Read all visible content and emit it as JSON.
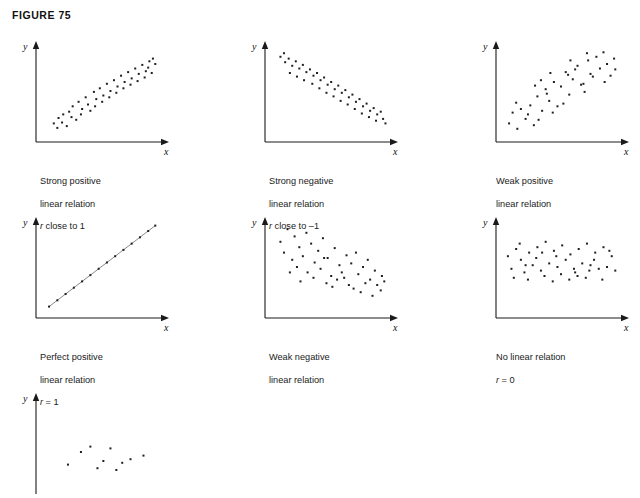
{
  "figure": {
    "title": "FIGURE 75",
    "axis_x_label": "x",
    "axis_y_label": "y",
    "background_color": "#ffffff",
    "ink_color": "#1a1a1a",
    "point_color": "#202020"
  },
  "chart_data": [
    {
      "type": "scatter",
      "title": "Strong positive linear relation",
      "caption_line1": "Strong positive",
      "caption_line2": "linear relation",
      "caption_r_prefix": "r",
      "caption_r_rest": " close to 1",
      "xlabel": "x",
      "ylabel": "y",
      "xlim": [
        0,
        100
      ],
      "ylim": [
        0,
        100
      ],
      "grid": false,
      "r_value": "close to 1",
      "points": [
        [
          10,
          14
        ],
        [
          14,
          20
        ],
        [
          13,
          9
        ],
        [
          18,
          24
        ],
        [
          17,
          15
        ],
        [
          21,
          11
        ],
        [
          23,
          27
        ],
        [
          26,
          33
        ],
        [
          25,
          21
        ],
        [
          29,
          18
        ],
        [
          31,
          38
        ],
        [
          34,
          30
        ],
        [
          33,
          24
        ],
        [
          37,
          43
        ],
        [
          39,
          35
        ],
        [
          41,
          28
        ],
        [
          44,
          49
        ],
        [
          46,
          41
        ],
        [
          45,
          33
        ],
        [
          49,
          53
        ],
        [
          52,
          45
        ],
        [
          51,
          38
        ],
        [
          55,
          58
        ],
        [
          58,
          50
        ],
        [
          57,
          43
        ],
        [
          61,
          62
        ],
        [
          64,
          55
        ],
        [
          63,
          48
        ],
        [
          67,
          67
        ],
        [
          70,
          60
        ],
        [
          69,
          53
        ],
        [
          73,
          71
        ],
        [
          76,
          64
        ],
        [
          75,
          57
        ],
        [
          79,
          75
        ],
        [
          82,
          69
        ],
        [
          81,
          61
        ],
        [
          85,
          79
        ],
        [
          88,
          72
        ],
        [
          87,
          65
        ],
        [
          91,
          83
        ],
        [
          90,
          76
        ],
        [
          94,
          86
        ],
        [
          93,
          70
        ],
        [
          96,
          80
        ]
      ]
    },
    {
      "type": "scatter",
      "title": "Strong negative linear relation",
      "caption_line1": "Strong negative",
      "caption_line2": "linear relation",
      "caption_r_prefix": "r",
      "caption_r_rest": " close to –1",
      "xlabel": "x",
      "ylabel": "y",
      "xlim": [
        0,
        100
      ],
      "ylim": [
        0,
        100
      ],
      "grid": false,
      "r_value": "close to -1",
      "points": [
        [
          8,
          88
        ],
        [
          12,
          82
        ],
        [
          11,
          92
        ],
        [
          15,
          86
        ],
        [
          18,
          78
        ],
        [
          16,
          70
        ],
        [
          21,
          83
        ],
        [
          24,
          75
        ],
        [
          22,
          66
        ],
        [
          27,
          79
        ],
        [
          30,
          71
        ],
        [
          28,
          62
        ],
        [
          33,
          74
        ],
        [
          36,
          67
        ],
        [
          35,
          58
        ],
        [
          39,
          70
        ],
        [
          42,
          62
        ],
        [
          41,
          53
        ],
        [
          45,
          65
        ],
        [
          48,
          57
        ],
        [
          47,
          48
        ],
        [
          51,
          60
        ],
        [
          54,
          52
        ],
        [
          53,
          44
        ],
        [
          57,
          56
        ],
        [
          60,
          48
        ],
        [
          59,
          39
        ],
        [
          63,
          51
        ],
        [
          66,
          43
        ],
        [
          65,
          35
        ],
        [
          69,
          46
        ],
        [
          72,
          38
        ],
        [
          71,
          30
        ],
        [
          75,
          41
        ],
        [
          78,
          33
        ],
        [
          77,
          25
        ],
        [
          81,
          36
        ],
        [
          84,
          28
        ],
        [
          83,
          21
        ],
        [
          87,
          31
        ],
        [
          90,
          24
        ],
        [
          89,
          17
        ],
        [
          93,
          27
        ],
        [
          95,
          19
        ],
        [
          97,
          14
        ]
      ]
    },
    {
      "type": "scatter",
      "title": "Weak positive linear relation",
      "caption_line1": "Weak positive",
      "caption_line2": "linear relation",
      "caption_r_prefix": "",
      "caption_r_rest": "",
      "xlabel": "x",
      "ylabel": "y",
      "xlim": [
        0,
        100
      ],
      "ylim": [
        0,
        100
      ],
      "grid": false,
      "r_value": "",
      "points": [
        [
          6,
          14
        ],
        [
          9,
          26
        ],
        [
          13,
          8
        ],
        [
          16,
          30
        ],
        [
          20,
          19
        ],
        [
          12,
          37
        ],
        [
          24,
          34
        ],
        [
          27,
          12
        ],
        [
          30,
          44
        ],
        [
          22,
          24
        ],
        [
          34,
          28
        ],
        [
          37,
          52
        ],
        [
          31,
          18
        ],
        [
          40,
          39
        ],
        [
          44,
          60
        ],
        [
          47,
          33
        ],
        [
          38,
          47
        ],
        [
          50,
          55
        ],
        [
          54,
          71
        ],
        [
          43,
          26
        ],
        [
          57,
          46
        ],
        [
          60,
          63
        ],
        [
          52,
          36
        ],
        [
          64,
          78
        ],
        [
          67,
          57
        ],
        [
          56,
          68
        ],
        [
          70,
          49
        ],
        [
          73,
          84
        ],
        [
          62,
          74
        ],
        [
          77,
          66
        ],
        [
          80,
          88
        ],
        [
          69,
          58
        ],
        [
          83,
          75
        ],
        [
          86,
          93
        ],
        [
          75,
          69
        ],
        [
          89,
          80
        ],
        [
          92,
          67
        ],
        [
          95,
          86
        ],
        [
          87,
          60
        ],
        [
          96,
          74
        ],
        [
          41,
          70
        ],
        [
          28,
          56
        ],
        [
          58,
          84
        ],
        [
          72,
          92
        ],
        [
          33,
          62
        ]
      ]
    },
    {
      "type": "scatter",
      "title": "Perfect positive linear relation",
      "caption_line1": "Perfect positive",
      "caption_line2": "linear relation",
      "caption_r_prefix": "r",
      "caption_r_rest": " = 1",
      "xlabel": "x",
      "ylabel": "y",
      "xlim": [
        0,
        100
      ],
      "ylim": [
        0,
        100
      ],
      "grid": false,
      "r_value": "1",
      "points": [
        [
          6,
          6
        ],
        [
          13,
          13
        ],
        [
          20,
          20
        ],
        [
          27,
          27
        ],
        [
          34,
          34
        ],
        [
          41,
          41
        ],
        [
          48,
          48
        ],
        [
          55,
          55
        ],
        [
          62,
          62
        ],
        [
          69,
          69
        ],
        [
          76,
          76
        ],
        [
          83,
          83
        ],
        [
          90,
          90
        ],
        [
          96,
          96
        ]
      ]
    },
    {
      "type": "scatter",
      "title": "Weak negative linear relation",
      "caption_line1": "Weak negative",
      "caption_line2": "linear relation",
      "caption_r_prefix": "",
      "caption_r_rest": "",
      "xlabel": "x",
      "ylabel": "y",
      "xlim": [
        0,
        100
      ],
      "ylim": [
        0,
        100
      ],
      "grid": false,
      "r_value": "",
      "points": [
        [
          8,
          78
        ],
        [
          14,
          92
        ],
        [
          20,
          84
        ],
        [
          11,
          66
        ],
        [
          24,
          72
        ],
        [
          30,
          88
        ],
        [
          18,
          58
        ],
        [
          27,
          62
        ],
        [
          34,
          76
        ],
        [
          40,
          68
        ],
        [
          22,
          50
        ],
        [
          37,
          55
        ],
        [
          44,
          82
        ],
        [
          31,
          44
        ],
        [
          48,
          60
        ],
        [
          54,
          71
        ],
        [
          42,
          48
        ],
        [
          58,
          52
        ],
        [
          36,
          38
        ],
        [
          51,
          40
        ],
        [
          64,
          63
        ],
        [
          60,
          44
        ],
        [
          47,
          32
        ],
        [
          68,
          54
        ],
        [
          72,
          66
        ],
        [
          56,
          36
        ],
        [
          74,
          42
        ],
        [
          66,
          30
        ],
        [
          78,
          50
        ],
        [
          82,
          58
        ],
        [
          70,
          26
        ],
        [
          84,
          36
        ],
        [
          88,
          46
        ],
        [
          76,
          22
        ],
        [
          90,
          30
        ],
        [
          94,
          40
        ],
        [
          86,
          18
        ],
        [
          93,
          24
        ],
        [
          62,
          38
        ],
        [
          52,
          28
        ],
        [
          80,
          32
        ],
        [
          96,
          34
        ],
        [
          45,
          60
        ],
        [
          25,
          34
        ],
        [
          16,
          44
        ]
      ]
    },
    {
      "type": "scatter",
      "title": "No linear relation",
      "caption_line1": "No linear relation",
      "caption_line2": "",
      "caption_r_prefix": "r",
      "caption_r_rest": " = 0",
      "xlabel": "x",
      "ylabel": "y",
      "xlim": [
        0,
        100
      ],
      "ylim": [
        0,
        100
      ],
      "grid": false,
      "r_value": "0",
      "points": [
        [
          5,
          62
        ],
        [
          8,
          48
        ],
        [
          12,
          70
        ],
        [
          10,
          38
        ],
        [
          16,
          58
        ],
        [
          19,
          44
        ],
        [
          15,
          76
        ],
        [
          23,
          66
        ],
        [
          26,
          52
        ],
        [
          22,
          36
        ],
        [
          30,
          72
        ],
        [
          33,
          46
        ],
        [
          29,
          60
        ],
        [
          37,
          78
        ],
        [
          40,
          54
        ],
        [
          36,
          40
        ],
        [
          44,
          68
        ],
        [
          47,
          50
        ],
        [
          43,
          34
        ],
        [
          51,
          74
        ],
        [
          54,
          58
        ],
        [
          50,
          42
        ],
        [
          58,
          64
        ],
        [
          61,
          48
        ],
        [
          57,
          36
        ],
        [
          65,
          70
        ],
        [
          68,
          54
        ],
        [
          64,
          40
        ],
        [
          72,
          76
        ],
        [
          75,
          52
        ],
        [
          71,
          38
        ],
        [
          79,
          66
        ],
        [
          82,
          48
        ],
        [
          78,
          58
        ],
        [
          86,
          72
        ],
        [
          89,
          50
        ],
        [
          85,
          36
        ],
        [
          93,
          62
        ],
        [
          96,
          46
        ],
        [
          91,
          68
        ],
        [
          34,
          66
        ],
        [
          62,
          44
        ],
        [
          20,
          52
        ],
        [
          46,
          62
        ],
        [
          74,
          46
        ]
      ]
    },
    {
      "type": "scatter",
      "title": "Partial clipped panel",
      "caption_line1": "",
      "caption_line2": "",
      "caption_r_prefix": "",
      "caption_r_rest": "",
      "xlabel": "",
      "ylabel": "y",
      "xlim": [
        0,
        100
      ],
      "ylim": [
        0,
        100
      ],
      "grid": false,
      "r_value": "",
      "clipped": true,
      "points": [
        [
          22,
          26
        ],
        [
          33,
          40
        ],
        [
          41,
          46
        ],
        [
          52,
          30
        ],
        [
          58,
          44
        ],
        [
          68,
          28
        ],
        [
          75,
          32
        ],
        [
          86,
          36
        ],
        [
          47,
          22
        ],
        [
          63,
          20
        ]
      ]
    }
  ]
}
